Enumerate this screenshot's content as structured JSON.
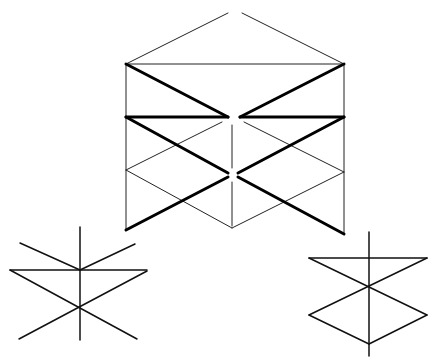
{
  "diagram": {
    "colors": {
      "background": "#ffffff",
      "line": "#000000"
    },
    "main_figure": {
      "thin_lines": [
        [
          126,
          64,
          228,
          13
        ],
        [
          242,
          13,
          344,
          64
        ],
        [
          126,
          64,
          344,
          64
        ],
        [
          126,
          64,
          126,
          230
        ],
        [
          344,
          64,
          344,
          234
        ],
        [
          126,
          170,
          222,
          122
        ],
        [
          126,
          170,
          232,
          228
        ],
        [
          232,
          228,
          344,
          172
        ],
        [
          244,
          122,
          344,
          172
        ],
        [
          232,
          125,
          232,
          168
        ],
        [
          232,
          182,
          232,
          226
        ]
      ],
      "thick_lines": [
        [
          126,
          64,
          228,
          117
        ],
        [
          240,
          117,
          344,
          64
        ],
        [
          126,
          117,
          228,
          117
        ],
        [
          240,
          117,
          344,
          117
        ],
        [
          126,
          117,
          228,
          173
        ],
        [
          238,
          173,
          344,
          117
        ],
        [
          126,
          230,
          228,
          177
        ],
        [
          238,
          177,
          344,
          234
        ]
      ]
    },
    "left_figure": {
      "lines": [
        [
          80,
          227,
          80,
          340
        ],
        [
          10,
          270,
          147,
          270
        ],
        [
          20,
          243,
          80,
          270
        ],
        [
          80,
          270,
          135,
          244
        ],
        [
          10,
          270,
          137,
          339
        ],
        [
          147,
          271,
          19,
          339
        ]
      ]
    },
    "right_figure": {
      "lines": [
        [
          369,
          232,
          369,
          356
        ],
        [
          309,
          258,
          427,
          258
        ],
        [
          309,
          258,
          427,
          315
        ],
        [
          427,
          258,
          309,
          315
        ],
        [
          309,
          315,
          369,
          344
        ],
        [
          369,
          344,
          427,
          315
        ]
      ]
    }
  }
}
